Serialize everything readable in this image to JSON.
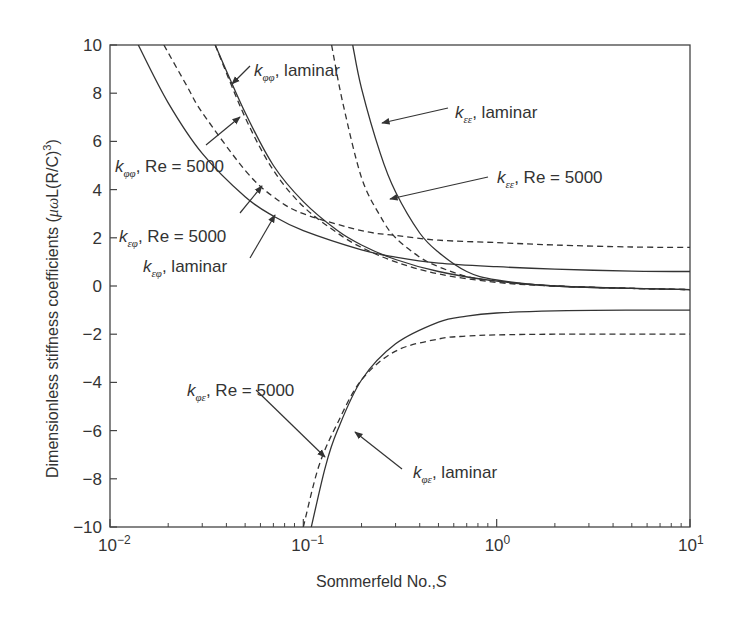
{
  "chart_data": {
    "type": "line",
    "title": "",
    "xlabel": "Sommerfeld No., S",
    "ylabel": "Dimensionless stiffness coefficients (μωL(R/C)^3)",
    "xscale": "log",
    "xlim": [
      0.01,
      10
    ],
    "ylim": [
      -10,
      10
    ],
    "xticks": [
      "10^-2",
      "10^-1",
      "10^0",
      "10^1"
    ],
    "yticks": [
      10,
      8,
      6,
      4,
      2,
      0,
      -2,
      -4,
      -6,
      -8,
      -10
    ],
    "grid": false,
    "legend": "inline annotations with arrows",
    "series": [
      {
        "name": "k_φφ, laminar",
        "style": "solid",
        "x": [
          0.035,
          0.05,
          0.07,
          0.1,
          0.15,
          0.2,
          0.3,
          0.5,
          1,
          2,
          5,
          10
        ],
        "y": [
          10,
          7.2,
          5.0,
          3.5,
          2.3,
          1.7,
          1.1,
          0.6,
          0.2,
          0.0,
          -0.1,
          -0.15
        ]
      },
      {
        "name": "k_φφ, Re=5000",
        "style": "dashed",
        "x": [
          0.035,
          0.05,
          0.07,
          0.1,
          0.15,
          0.2,
          0.3,
          0.5,
          1,
          2,
          5,
          10
        ],
        "y": [
          10,
          7.0,
          4.8,
          3.3,
          2.2,
          1.6,
          1.0,
          0.5,
          0.15,
          0.0,
          -0.1,
          -0.15
        ]
      },
      {
        "name": "k_εφ, laminar",
        "style": "solid",
        "x": [
          0.014,
          0.02,
          0.03,
          0.05,
          0.07,
          0.1,
          0.2,
          0.3,
          0.5,
          1,
          2,
          5,
          10
        ],
        "y": [
          10,
          7.6,
          5.5,
          3.7,
          2.9,
          2.3,
          1.5,
          1.2,
          0.95,
          0.8,
          0.7,
          0.62,
          0.6
        ]
      },
      {
        "name": "k_εφ, Re=5000",
        "style": "dashed",
        "x": [
          0.019,
          0.025,
          0.03,
          0.05,
          0.07,
          0.1,
          0.2,
          0.3,
          0.5,
          1,
          2,
          5,
          10
        ],
        "y": [
          10,
          8.3,
          7.2,
          4.8,
          3.7,
          3.0,
          2.3,
          2.1,
          1.9,
          1.8,
          1.7,
          1.62,
          1.6
        ]
      },
      {
        "name": "k_εε, laminar",
        "style": "solid",
        "x": [
          0.18,
          0.2,
          0.25,
          0.3,
          0.4,
          0.5,
          0.7,
          1,
          2,
          5,
          10
        ],
        "y": [
          10,
          8.2,
          5.5,
          3.9,
          2.2,
          1.4,
          0.6,
          0.25,
          0.0,
          -0.1,
          -0.15
        ]
      },
      {
        "name": "k_εε, Re=5000",
        "style": "dashed",
        "x": [
          0.14,
          0.16,
          0.2,
          0.25,
          0.3,
          0.4,
          0.5,
          0.7,
          1,
          2,
          5,
          10
        ],
        "y": [
          10,
          7.6,
          4.5,
          2.9,
          2.0,
          1.2,
          0.8,
          0.4,
          0.2,
          0.0,
          -0.1,
          -0.15
        ]
      },
      {
        "name": "k_φε, laminar",
        "style": "solid",
        "x": [
          0.11,
          0.13,
          0.15,
          0.2,
          0.3,
          0.5,
          0.7,
          1,
          2,
          5,
          10
        ],
        "y": [
          -10,
          -7.5,
          -6.0,
          -3.9,
          -2.4,
          -1.5,
          -1.25,
          -1.12,
          -1.03,
          -1.0,
          -1.0
        ]
      },
      {
        "name": "k_φε, Re=5000",
        "style": "dashed",
        "x": [
          0.1,
          0.12,
          0.15,
          0.2,
          0.3,
          0.5,
          0.7,
          1,
          2,
          5,
          10
        ],
        "y": [
          -10,
          -7.5,
          -5.7,
          -3.9,
          -2.7,
          -2.2,
          -2.08,
          -2.03,
          -2.0,
          -2.0,
          -2.0
        ]
      }
    ],
    "annotations": [
      {
        "text": "k_φφ, laminar",
        "label_at": [
          0.065,
          8.7
        ]
      },
      {
        "text": "k_φφ, Re = 5000",
        "label_at": [
          0.011,
          5.0
        ]
      },
      {
        "text": "k_εφ, Re = 5000",
        "label_at": [
          0.011,
          2.0
        ]
      },
      {
        "text": "k_εφ, laminar",
        "label_at": [
          0.015,
          0.5
        ]
      },
      {
        "text": "k_εε, laminar",
        "label_at": [
          0.95,
          7.6
        ]
      },
      {
        "text": "k_εε, Re = 5000",
        "label_at": [
          1.5,
          4.6
        ]
      },
      {
        "text": "k_φε, Re = 5000",
        "label_at": [
          0.033,
          -4.2
        ]
      },
      {
        "text": "k_φε, laminar",
        "label_at": [
          0.75,
          -8.0
        ]
      }
    ]
  },
  "labels": {
    "xlabel": "Sommerfeld No.,",
    "xlabel_var": "S",
    "ylabel_main": "Dimensionless stiffness coefficients (",
    "ylabel_math": "μω",
    "ylabel_tail": "L(R/C)",
    "ylabel_exp": "3",
    "ylabel_close": ")",
    "x_base": "10",
    "x_exps": [
      "−2",
      "−1",
      "0",
      "1"
    ],
    "ann": [
      {
        "k": "k",
        "sub": "φφ",
        "rest": ", laminar"
      },
      {
        "k": "k",
        "sub": "φφ",
        "rest": ", Re = 5000"
      },
      {
        "k": "k",
        "sub": "εφ",
        "rest": ", Re = 5000"
      },
      {
        "k": "k",
        "sub": "εφ",
        "rest": ", laminar"
      },
      {
        "k": "k",
        "sub": "εε",
        "rest": ", laminar"
      },
      {
        "k": "k",
        "sub": "εε",
        "rest": ", Re = 5000"
      },
      {
        "k": "k",
        "sub": "φε",
        "rest": ", Re = 5000"
      },
      {
        "k": "k",
        "sub": "φε",
        "rest": ", laminar"
      }
    ]
  },
  "colors": {
    "line": "#333333",
    "axis": "#444444"
  }
}
